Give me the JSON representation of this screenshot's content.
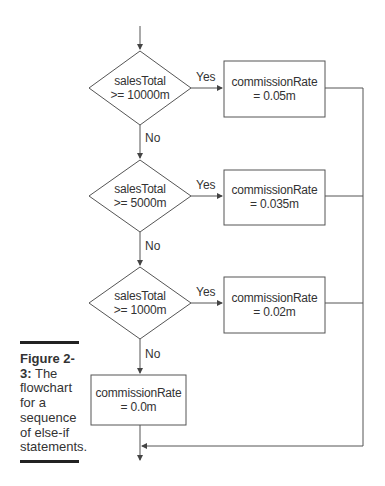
{
  "diagram": {
    "type": "flowchart",
    "decisions": [
      {
        "line1": "salesTotal",
        "line2": ">= 10000m",
        "yes_label": "Yes",
        "no_label": "No"
      },
      {
        "line1": "salesTotal",
        "line2": ">= 5000m",
        "yes_label": "Yes",
        "no_label": "No"
      },
      {
        "line1": "salesTotal",
        "line2": ">= 1000m",
        "yes_label": "Yes",
        "no_label": "No"
      }
    ],
    "actions": [
      {
        "line1": "commissionRate",
        "line2": "= 0.05m"
      },
      {
        "line1": "commissionRate",
        "line2": "= 0.035m"
      },
      {
        "line1": "commissionRate",
        "line2": "= 0.02m"
      }
    ],
    "default_action": {
      "line1": "commissionRate",
      "line2": "= 0.0m"
    }
  },
  "caption": {
    "figure_label": "Figure 2-3:",
    "text": "The flowchart for a sequence of else-if statements."
  },
  "colors": {
    "line": "#555555",
    "text": "#333333",
    "rule": "#222222"
  }
}
